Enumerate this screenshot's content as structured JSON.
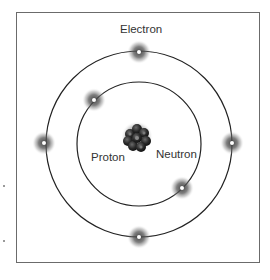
{
  "diagram": {
    "type": "atom-model",
    "labels": {
      "electron": "Electron",
      "proton": "Proton",
      "neutron": "Neutron"
    },
    "colors": {
      "orbit": "#222222",
      "frame": "#6b6b6b",
      "electron_glow": "#555555",
      "electron_core": "#ffffff",
      "nucleus": "#1e1e1e"
    },
    "orbits": [
      {
        "name": "inner",
        "cx": 139,
        "cy": 144,
        "r": 62
      },
      {
        "name": "outer",
        "cx": 139,
        "cy": 144,
        "r": 93
      }
    ],
    "electrons": [
      {
        "orbit": "outer",
        "x": 139,
        "y": 52
      },
      {
        "orbit": "outer",
        "x": 44,
        "y": 143
      },
      {
        "orbit": "outer",
        "x": 232,
        "y": 143
      },
      {
        "orbit": "outer",
        "x": 139,
        "y": 237
      },
      {
        "orbit": "inner",
        "x": 94,
        "y": 100
      },
      {
        "orbit": "inner",
        "x": 182,
        "y": 188
      }
    ]
  }
}
